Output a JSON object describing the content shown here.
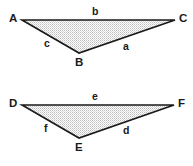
{
  "figure": {
    "background_color": "#ffffff",
    "stroke_color": "#1a1a1a",
    "fill_pattern": "stipple-dots",
    "fill_color": "#b4b4b4",
    "fill_background": "#ffffff"
  },
  "triangles": [
    {
      "name": "triangle-abc",
      "vertices": [
        {
          "label": "A",
          "x": 22,
          "y": 20
        },
        {
          "label": "C",
          "x": 175,
          "y": 20
        },
        {
          "label": "B",
          "x": 79,
          "y": 53
        }
      ],
      "vertex_labels": [
        {
          "text": "A",
          "x": 9,
          "y": 13
        },
        {
          "text": "C",
          "x": 179,
          "y": 13
        },
        {
          "text": "B",
          "x": 75,
          "y": 57
        }
      ],
      "side_labels": [
        {
          "text": "b",
          "x": 92,
          "y": 6
        },
        {
          "text": "c",
          "x": 44,
          "y": 38
        },
        {
          "text": "a",
          "x": 123,
          "y": 41
        }
      ]
    },
    {
      "name": "triangle-def",
      "vertices": [
        {
          "label": "D",
          "x": 22,
          "y": 105
        },
        {
          "label": "F",
          "x": 174,
          "y": 105
        },
        {
          "label": "E",
          "x": 79,
          "y": 138
        }
      ],
      "vertex_labels": [
        {
          "text": "D",
          "x": 9,
          "y": 98
        },
        {
          "text": "F",
          "x": 178,
          "y": 98
        },
        {
          "text": "E",
          "x": 75,
          "y": 142
        }
      ],
      "side_labels": [
        {
          "text": "e",
          "x": 92,
          "y": 91
        },
        {
          "text": "f",
          "x": 44,
          "y": 123
        },
        {
          "text": "d",
          "x": 123,
          "y": 125
        }
      ]
    }
  ]
}
